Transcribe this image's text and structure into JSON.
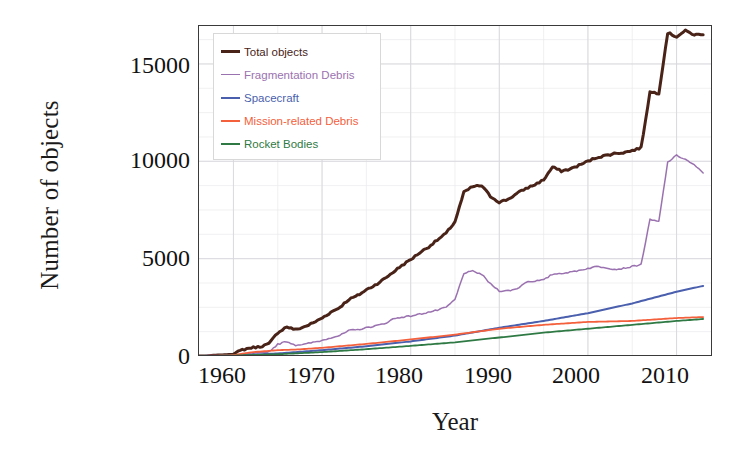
{
  "chart_data": {
    "type": "line",
    "title": "",
    "xlabel": "Year",
    "ylabel": "Number of objects",
    "xlim": [
      1956,
      2014
    ],
    "ylim": [
      0,
      17000
    ],
    "xticks": [
      1960,
      1970,
      1980,
      1990,
      2000,
      2010
    ],
    "yticks": [
      0,
      5000,
      10000,
      15000
    ],
    "grid": true,
    "grid_minor": true,
    "legend_position": "upper-left inside",
    "colors": {
      "total_objects": "#4a2318",
      "fragmentation_debris": "#9b72b0",
      "spacecraft": "#4a5fad",
      "mission_related_debris": "#f4603c",
      "rocket_bodies": "#2f7a44"
    },
    "series": [
      {
        "name": "Total objects",
        "color": "#4a2318",
        "x": [
          1956,
          1957,
          1958,
          1959,
          1960,
          1961,
          1962,
          1963,
          1964,
          1965,
          1966,
          1967,
          1968,
          1969,
          1970,
          1971,
          1972,
          1973,
          1974,
          1975,
          1976,
          1977,
          1978,
          1979,
          1980,
          1981,
          1982,
          1983,
          1984,
          1985,
          1986,
          1987,
          1988,
          1989,
          1990,
          1991,
          1992,
          1993,
          1994,
          1995,
          1996,
          1997,
          1998,
          1999,
          2000,
          2001,
          2002,
          2003,
          2004,
          2005,
          2006,
          2007,
          2008,
          2009,
          2010,
          2011,
          2012,
          2013
        ],
        "values": [
          0,
          5,
          40,
          60,
          90,
          320,
          420,
          480,
          620,
          1200,
          1500,
          1350,
          1500,
          1700,
          1950,
          2250,
          2500,
          2900,
          3100,
          3400,
          3650,
          3950,
          4300,
          4650,
          4950,
          5300,
          5600,
          5950,
          6300,
          6900,
          8400,
          8700,
          8750,
          8200,
          7900,
          8050,
          8350,
          8600,
          8800,
          9050,
          9700,
          9500,
          9600,
          9800,
          10000,
          10200,
          10300,
          10400,
          10450,
          10550,
          10700,
          13550,
          13500,
          16600,
          16400,
          16700,
          16500,
          16500
        ]
      },
      {
        "name": "Fragmentation Debris",
        "color": "#9b72b0",
        "x": [
          1956,
          1960,
          1961,
          1962,
          1963,
          1964,
          1965,
          1966,
          1967,
          1968,
          1969,
          1970,
          1971,
          1972,
          1973,
          1974,
          1975,
          1976,
          1977,
          1978,
          1979,
          1980,
          1981,
          1982,
          1983,
          1984,
          1985,
          1986,
          1987,
          1988,
          1989,
          1990,
          1991,
          1992,
          1993,
          1994,
          1995,
          1996,
          1997,
          1998,
          1999,
          2000,
          2001,
          2002,
          2003,
          2004,
          2005,
          2006,
          2007,
          2008,
          2009,
          2010,
          2011,
          2012,
          2013
        ],
        "values": [
          0,
          20,
          100,
          130,
          160,
          220,
          600,
          750,
          560,
          600,
          700,
          800,
          950,
          1050,
          1300,
          1350,
          1450,
          1550,
          1650,
          1900,
          2000,
          2050,
          2150,
          2250,
          2350,
          2500,
          2900,
          4250,
          4350,
          4200,
          3700,
          3350,
          3350,
          3450,
          3800,
          3850,
          3900,
          4200,
          4250,
          4300,
          4400,
          4500,
          4600,
          4550,
          4450,
          4500,
          4600,
          4700,
          7000,
          6900,
          9950,
          10300,
          10100,
          9800,
          9400
        ]
      },
      {
        "name": "Spacecraft",
        "color": "#4a5fad",
        "x": [
          1956,
          1960,
          1965,
          1970,
          1975,
          1980,
          1985,
          1990,
          1995,
          2000,
          2005,
          2010,
          2013
        ],
        "values": [
          0,
          30,
          130,
          300,
          500,
          750,
          1050,
          1450,
          1800,
          2200,
          2700,
          3300,
          3600
        ]
      },
      {
        "name": "Mission-related Debris",
        "color": "#f4603c",
        "x": [
          1956,
          1960,
          1962,
          1965,
          1967,
          1970,
          1975,
          1980,
          1985,
          1990,
          1995,
          2000,
          2005,
          2010,
          2013
        ],
        "values": [
          0,
          40,
          190,
          300,
          330,
          420,
          620,
          850,
          1100,
          1400,
          1600,
          1750,
          1800,
          1950,
          2000
        ]
      },
      {
        "name": "Rocket Bodies",
        "color": "#2f7a44",
        "x": [
          1956,
          1960,
          1965,
          1970,
          1975,
          1980,
          1985,
          1990,
          1995,
          2000,
          2005,
          2010,
          2013
        ],
        "values": [
          0,
          20,
          90,
          200,
          350,
          520,
          700,
          950,
          1200,
          1400,
          1600,
          1800,
          1900
        ]
      }
    ]
  },
  "axes": {
    "ylabel": "Number of objects",
    "xlabel": "Year",
    "ytick_labels": [
      "15000",
      "10000",
      "5000",
      "0"
    ],
    "xtick_labels": [
      "1960",
      "1970",
      "1980",
      "1990",
      "2000",
      "2010"
    ]
  },
  "legend": {
    "entries": [
      {
        "label": "Total objects",
        "color": "#4a2318",
        "weight": 3
      },
      {
        "label": "Fragmentation Debris",
        "color": "#9b72b0",
        "weight": 1.6
      },
      {
        "label": "Spacecraft",
        "color": "#4a5fad",
        "weight": 2.2
      },
      {
        "label": "Mission-related Debris",
        "color": "#f4603c",
        "weight": 2.2
      },
      {
        "label": "Rocket Bodies",
        "color": "#2f7a44",
        "weight": 2.4
      }
    ]
  }
}
